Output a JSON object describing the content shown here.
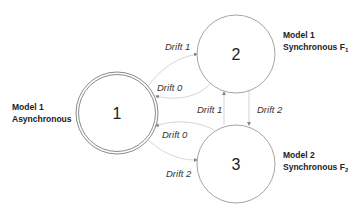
{
  "diagram": {
    "type": "state-transition",
    "nodes": [
      {
        "id": "1",
        "label": "1",
        "style": "double-circle",
        "title_line1": "Model 1",
        "title_line2": "Asynchronous",
        "title_sub": ""
      },
      {
        "id": "2",
        "label": "2",
        "style": "circle",
        "title_line1": "Model 1",
        "title_line2": "Synchronous F",
        "title_sub": "1"
      },
      {
        "id": "3",
        "label": "3",
        "style": "circle",
        "title_line1": "Model 2",
        "title_line2": "Synchronous F",
        "title_sub": "2"
      }
    ],
    "edges": [
      {
        "from": "1",
        "to": "2",
        "label": "Drift 1"
      },
      {
        "from": "2",
        "to": "1",
        "label": "Drift 0"
      },
      {
        "from": "3",
        "to": "1",
        "label": "Drift 0"
      },
      {
        "from": "1",
        "to": "3",
        "label": "Drift 2"
      },
      {
        "from": "3",
        "to": "2",
        "label": "Drift 1"
      },
      {
        "from": "2",
        "to": "3",
        "label": "Drift 2"
      }
    ],
    "colors": {
      "node_stroke": "#8a8a8a",
      "edge_stroke": "#d6d6d6",
      "text": "#222222"
    }
  }
}
